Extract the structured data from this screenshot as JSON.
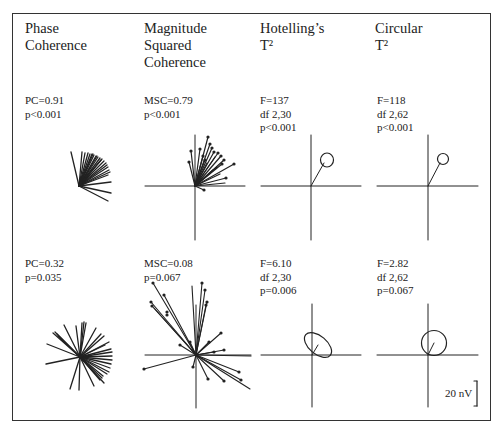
{
  "figure": {
    "columns": [
      {
        "id": "phase-coherence",
        "title": "Phase\nCoherence"
      },
      {
        "id": "magnitude-squared-coherence",
        "title": "Magnitude\nSquared\nCoherence"
      },
      {
        "id": "hotellings-t2",
        "title": "Hotelling’s\nT²"
      },
      {
        "id": "circular-t2",
        "title": "Circular\nT²"
      }
    ],
    "rows": [
      {
        "id": "strong-response",
        "stats": [
          "PC=0.91\np<0.001",
          "MSC=0.79\np<0.001",
          "F=137\ndf 2,30\np<0.001",
          "F=118\ndf 2,62\np<0.001"
        ]
      },
      {
        "id": "weak-response",
        "stats": [
          "PC=0.32\np=0.035",
          "MSC=0.08\np=0.067",
          "F=6.10\ndf 2,30\np=0.006",
          "F=2.82\ndf 2,62\np=0.067"
        ]
      }
    ],
    "scale_bar": {
      "label": "20 nV"
    },
    "colors": {
      "ink": "#222222",
      "frame": "#333333",
      "background": "#ffffff"
    }
  }
}
